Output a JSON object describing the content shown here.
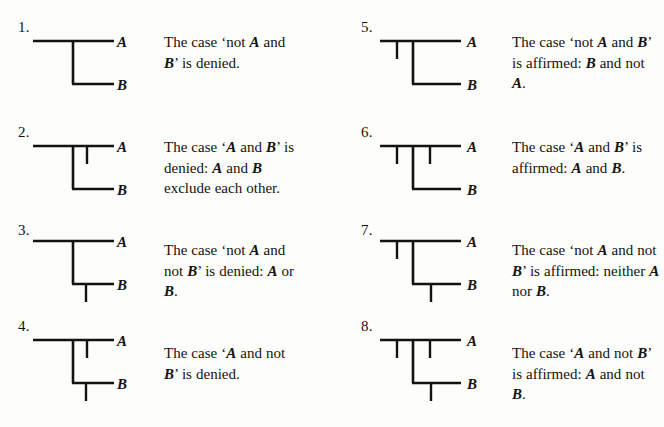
{
  "page": {
    "background_color": "#fdfdfb",
    "ink_color": "#141210",
    "columns": 2,
    "entry_count": 8
  },
  "entries": [
    {
      "number": "1.",
      "label_a": "A",
      "label_b": "B",
      "caption_text": "The case 'not A and B' is denied.",
      "caption_html": "The case 'not <i>A</i> and <i>B</i>' is denied.",
      "diagram": {
        "name": "existential-graph-1",
        "a_line": true,
        "b_line": true,
        "connector": true,
        "tick_a_left": false,
        "tick_a_right": false,
        "tick_b": false
      }
    },
    {
      "number": "2.",
      "label_a": "A",
      "label_b": "B",
      "caption_text": "The case 'A and B' is denied: A and B exclude each other.",
      "caption_html": "The case '<i>A</i> and <i>B</i>' is denied: <i>A</i> and <i>B</i> exclude each other.",
      "diagram": {
        "name": "existential-graph-2",
        "a_line": true,
        "b_line": true,
        "connector": true,
        "tick_a_left": false,
        "tick_a_right": true,
        "tick_b": false
      }
    },
    {
      "number": "3.",
      "label_a": "A",
      "label_b": "B",
      "caption_text": "The case 'not A and not B' is denied: A or B.",
      "caption_html": "The case 'not <i>A</i> and not <i>B</i>' is denied: <i>A</i> or <i>B</i>.",
      "diagram": {
        "name": "existential-graph-3",
        "a_line": true,
        "b_line": true,
        "connector": true,
        "tick_a_left": false,
        "tick_a_right": false,
        "tick_b": true
      }
    },
    {
      "number": "4.",
      "label_a": "A",
      "label_b": "B",
      "caption_text": "The case 'A and not B' is denied.",
      "caption_html": "The case '<i>A</i> and not <i>B</i>' is denied.",
      "diagram": {
        "name": "existential-graph-4",
        "a_line": true,
        "b_line": true,
        "connector": true,
        "tick_a_left": false,
        "tick_a_right": true,
        "tick_b": true
      }
    },
    {
      "number": "5.",
      "label_a": "A",
      "label_b": "B",
      "caption_text": "The case 'not A and B' is affirmed: B and not A.",
      "caption_html": "The case 'not <i>A</i> and <i>B</i>' is affirmed: <i>B</i> and not <i>A</i>.",
      "diagram": {
        "name": "existential-graph-5",
        "a_line": true,
        "b_line": true,
        "connector": true,
        "tick_a_left": true,
        "tick_a_right": false,
        "tick_b": false
      }
    },
    {
      "number": "6.",
      "label_a": "A",
      "label_b": "B",
      "caption_text": "The case 'A and B' is affirmed: A and B.",
      "caption_html": "The case '<i>A</i> and <i>B</i>' is affirmed: <i>A</i> and <i>B</i>.",
      "diagram": {
        "name": "existential-graph-6",
        "a_line": true,
        "b_line": true,
        "connector": true,
        "tick_a_left": true,
        "tick_a_right": true,
        "tick_b": false
      }
    },
    {
      "number": "7.",
      "label_a": "A",
      "label_b": "B",
      "caption_text": "The case 'not A and not B' is affirmed: neither A nor B.",
      "caption_html": "The case 'not <i>A</i> and not <i>B</i>' is affirmed: neither <i>A</i> nor <i>B</i>.",
      "diagram": {
        "name": "existential-graph-7",
        "a_line": true,
        "b_line": true,
        "connector": true,
        "tick_a_left": true,
        "tick_a_right": false,
        "tick_b": true
      }
    },
    {
      "number": "8.",
      "label_a": "A",
      "label_b": "B",
      "caption_text": "The case 'A and not B' is affirmed: A and not B.",
      "caption_html": "The case '<i>A</i> and not <i>B</i>' is affirmed: <i>A</i> and not <i>B</i>.",
      "diagram": {
        "name": "existential-graph-8",
        "a_line": true,
        "b_line": true,
        "connector": true,
        "tick_a_left": true,
        "tick_a_right": true,
        "tick_b": true
      }
    }
  ]
}
